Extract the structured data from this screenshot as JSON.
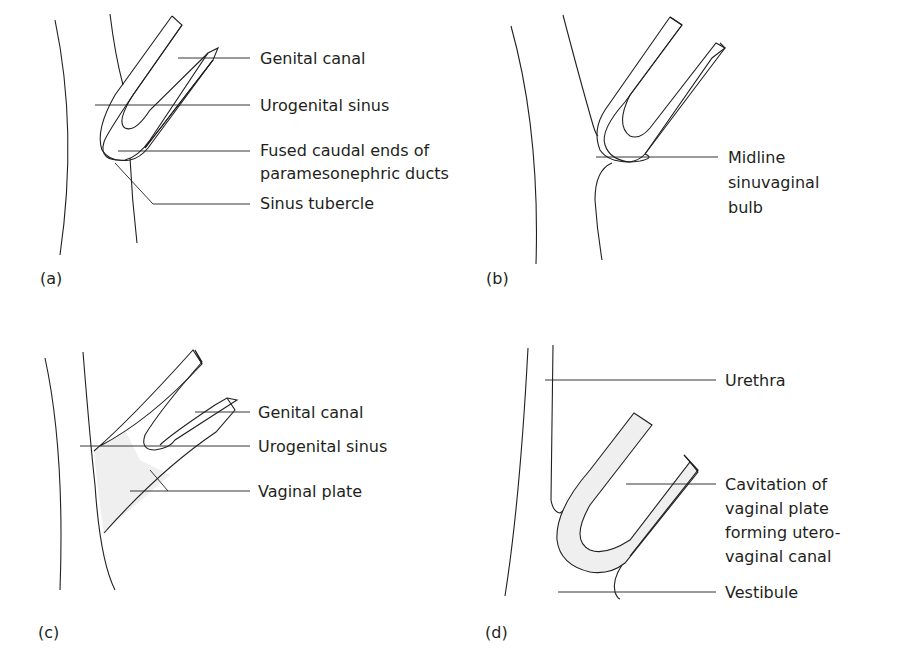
{
  "figure": {
    "panels": [
      {
        "id": "a",
        "tag": "(a)",
        "labels": [
          {
            "lines": [
              "Genital canal"
            ]
          },
          {
            "lines": [
              "Urogenital sinus"
            ]
          },
          {
            "lines": [
              "Fused caudal ends of",
              "paramesonephric ducts"
            ]
          },
          {
            "lines": [
              "Sinus tubercle"
            ]
          }
        ]
      },
      {
        "id": "b",
        "tag": "(b)",
        "labels": [
          {
            "lines": [
              "Midline",
              "sinuvaginal",
              "bulb"
            ]
          }
        ]
      },
      {
        "id": "c",
        "tag": "(c)",
        "labels": [
          {
            "lines": [
              "Genital canal"
            ]
          },
          {
            "lines": [
              "Urogenital sinus"
            ]
          },
          {
            "lines": [
              "Vaginal plate"
            ]
          }
        ]
      },
      {
        "id": "d",
        "tag": "(d)",
        "labels": [
          {
            "lines": [
              "Urethra"
            ]
          },
          {
            "lines": [
              "Cavitation of",
              "vaginal plate",
              "forming utero-",
              "vaginal canal"
            ]
          },
          {
            "lines": [
              "Vestibule"
            ]
          }
        ]
      }
    ],
    "colors": {
      "line": "#231f20",
      "fill": "#efefef",
      "background": "#ffffff"
    }
  }
}
